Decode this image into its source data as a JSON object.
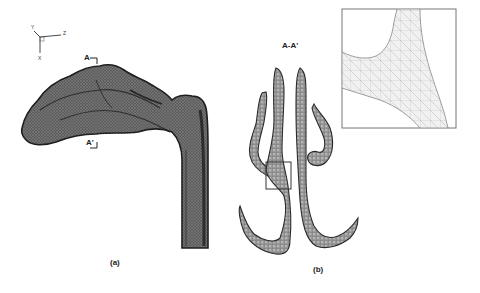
{
  "figure": {
    "panel_a": {
      "caption": "(a)",
      "section_markers": {
        "top": "A",
        "bottom": "A'"
      },
      "axes": {
        "y": "Y",
        "z": "Z",
        "x": "X"
      }
    },
    "panel_b": {
      "caption": "(b)",
      "section_title": "A-A'"
    },
    "colors": {
      "mesh_dark": "#3a3a3a",
      "mesh_mid": "#6e6e6e",
      "mesh_light": "#c8c8c8",
      "inset_border": "#777777",
      "background": "#ffffff"
    }
  }
}
